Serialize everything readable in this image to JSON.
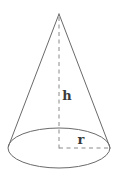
{
  "figure": {
    "name": "cone-with-height-and-radius",
    "kind": "geometric-solid-diagram",
    "shape_label": "cone",
    "background_color": "#ffffff",
    "stroke_color": "#6a6a6a",
    "dashed_stroke_color": "#8a8a8a",
    "label_color": "#3a3a3a",
    "labels": {
      "height": "h",
      "radius": "r"
    },
    "geometry": {
      "apex": {
        "x": 59,
        "y": 14
      },
      "base_center": {
        "x": 59,
        "y": 148
      },
      "base_rx": 51,
      "base_ry": 20,
      "left_base_point": {
        "x": 8,
        "y": 147
      },
      "right_base_point": {
        "x": 110,
        "y": 147
      },
      "height_line": {
        "x1": 59,
        "y1": 16,
        "x2": 59,
        "y2": 148
      },
      "radius_line": {
        "x1": 59,
        "y1": 148,
        "x2": 110,
        "y2": 148
      },
      "height_label_pos": {
        "x": 67,
        "y": 100
      },
      "radius_label_pos": {
        "x": 81,
        "y": 144
      }
    }
  }
}
